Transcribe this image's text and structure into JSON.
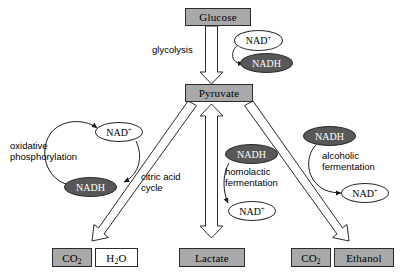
{
  "diagram": {
    "colors": {
      "metabolite_fill": "#a9a9a9",
      "metabolite_hollow_fill": "#ffffff",
      "nadh_fill": "#585858",
      "nad_fill": "#ffffff",
      "stroke": "#2b2b2b",
      "text": "#000000",
      "nadh_text": "#ffffff",
      "background": "#ffffff"
    },
    "metabolites": [
      {
        "id": "glucose",
        "label": "Glucose",
        "style": "filled"
      },
      {
        "id": "pyruvate",
        "label": "Pyruvate",
        "style": "filled"
      },
      {
        "id": "co2_left",
        "label": "CO2",
        "label_base": "CO",
        "label_sub": "2",
        "style": "filled"
      },
      {
        "id": "h2o",
        "label": "H2O",
        "label_base": "H",
        "label_sub": "2",
        "label_tail": "O",
        "style": "hollow"
      },
      {
        "id": "lactate",
        "label": "Lactate",
        "style": "filled"
      },
      {
        "id": "co2_right",
        "label": "CO2",
        "label_base": "CO",
        "label_sub": "2",
        "style": "filled"
      },
      {
        "id": "ethanol",
        "label": "Ethanol",
        "style": "filled"
      }
    ],
    "cofactors": [
      {
        "id": "nad-glycolysis",
        "label": "NAD",
        "charge": "+",
        "state": "oxidized"
      },
      {
        "id": "nadh-glycolysis",
        "label": "NADH",
        "charge": "",
        "state": "reduced"
      },
      {
        "id": "nad-oxphos",
        "label": "NAD",
        "charge": "+",
        "state": "oxidized"
      },
      {
        "id": "nadh-oxphos",
        "label": "NADH",
        "charge": "",
        "state": "reduced"
      },
      {
        "id": "nadh-homolactic",
        "label": "NADH",
        "charge": "",
        "state": "reduced"
      },
      {
        "id": "nad-homolactic",
        "label": "NAD",
        "charge": "+",
        "state": "oxidized"
      },
      {
        "id": "nadh-alcoholic",
        "label": "NADH",
        "charge": "",
        "state": "reduced"
      },
      {
        "id": "nad-alcoholic",
        "label": "NAD",
        "charge": "+",
        "state": "oxidized"
      }
    ],
    "pathway_labels": [
      {
        "id": "glycolysis",
        "text": "glycolysis"
      },
      {
        "id": "oxidative-phosphorylation",
        "text": "oxidative\nphosphorylation"
      },
      {
        "id": "citric-acid-cycle",
        "text": "citric acid\ncycle"
      },
      {
        "id": "homolactic-fermentation",
        "text": "homolactic\nfermentation"
      },
      {
        "id": "alcoholic-fermentation",
        "text": "alcoholic\nfermentation"
      }
    ]
  }
}
